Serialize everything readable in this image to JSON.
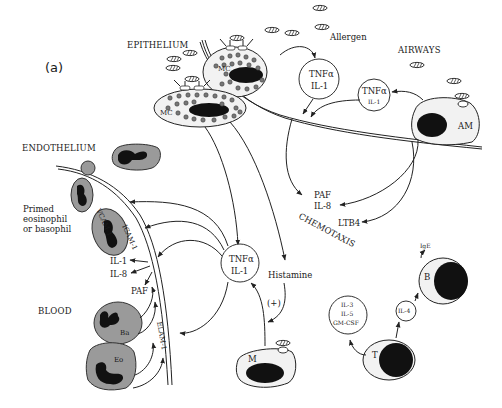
{
  "figure": {
    "panel_label": "(a)",
    "regions": {
      "epithelium": "EPITHELIUM",
      "airways": "AIRWAYS",
      "endothelium": "ENDOTHELIUM",
      "blood": "BLOOD"
    },
    "labels": {
      "allergen": "Allergen",
      "primed_cell_line1": "Primed",
      "primed_cell_line2": "eosinophil",
      "primed_cell_line3": "or basophil",
      "chemotaxis": "CHEMOTAXIS",
      "histamine": "Histamine",
      "plus": "(+)"
    },
    "cells": {
      "mast_cell_upper": "MC",
      "mast_cell_lower": "MC",
      "alveolar_macrophage": "AM",
      "basophil": "Ba",
      "eosinophil": "Eo",
      "macrophage": "M",
      "t_cell": "T",
      "b_cell": "B"
    },
    "mediators": {
      "tnf_il1_top_line1": "TNFα",
      "tnf_il1_top_line2": "IL-1",
      "tnf_il1_am_line1": "TNFα",
      "tnf_il1_am_line2": "IL-1",
      "tnf_il1_center_line1": "TNFα",
      "tnf_il1_center_line2": "IL-1",
      "paf_il8_line1": "PAF",
      "paf_il8_line2": "IL-8",
      "ltb4": "LTB4",
      "il1_endo": "IL-1",
      "il8_endo": "IL-8",
      "paf_endo": "PAF",
      "il3": "IL-3",
      "il5": "IL-5",
      "gmcsf": "GM-CSF",
      "il4": "IL-4",
      "ige": "IgE"
    },
    "adhesion_molecules": {
      "vcam": "VCAM-1",
      "icam": "ICAM-1",
      "elam": "ELAM-1"
    }
  }
}
